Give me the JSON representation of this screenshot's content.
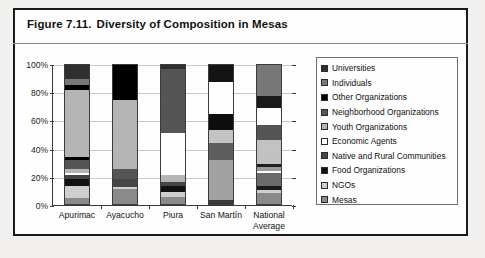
{
  "figure": {
    "number": "Figure 7.11.",
    "title": "Diversity of Composition in Mesas"
  },
  "legend": {
    "position": "right",
    "items": [
      {
        "label": "Universities",
        "color": "#2f2f2f"
      },
      {
        "label": "Individuals",
        "color": "#787878"
      },
      {
        "label": "Other Organizations",
        "color": "#000000"
      },
      {
        "label": "Neighborhood Organizations",
        "color": "#555555"
      },
      {
        "label": "Youth Organizations",
        "color": "#b5b5b5"
      },
      {
        "label": "Economic Agents",
        "color": "#ffffff"
      },
      {
        "label": "Native and Rural Communities",
        "color": "#454545"
      },
      {
        "label": "Food Organizations",
        "color": "#111111"
      },
      {
        "label": "NGOs",
        "color": "#cfcfcf"
      },
      {
        "label": "Mesas",
        "color": "#8a8a8a"
      }
    ]
  },
  "chart_data": {
    "type": "bar",
    "stacked": true,
    "normalized": "100%",
    "title": "Diversity of Composition in Mesas",
    "xlabel": "",
    "ylabel": "",
    "ylim": [
      0,
      100
    ],
    "yticks": [
      0,
      20,
      40,
      60,
      80,
      100
    ],
    "ytick_labels": [
      "0%",
      "20%",
      "40%",
      "60%",
      "80%",
      "100%"
    ],
    "grid": true,
    "legend_position": "right",
    "categories": [
      "Apurimac",
      "Ayacucho",
      "Piura",
      "San Martín",
      "National Average"
    ],
    "series": [
      {
        "name": "Mesas",
        "color": "#8a8a8a",
        "values": [
          4,
          11,
          5,
          3,
          8
        ]
      },
      {
        "name": "NGOs",
        "color": "#cfcfcf",
        "values": [
          9,
          7,
          4,
          29,
          9
        ]
      },
      {
        "name": "Food Organizations",
        "color": "#111111",
        "values": [
          5,
          0,
          4,
          0,
          4
        ]
      },
      {
        "name": "Native and Rural Communities",
        "color": "#454545",
        "values": [
          3,
          0,
          3,
          12,
          5
        ]
      },
      {
        "name": "Economic Agents",
        "color": "#ffffff",
        "values": [
          1,
          0,
          0,
          0,
          2
        ]
      },
      {
        "name": "Youth Organizations",
        "color": "#b5b5b5",
        "values": [
          3,
          0,
          5,
          9,
          3
        ]
      },
      {
        "name": "Neighborhood Organizations",
        "color": "#555555",
        "values": [
          7,
          7,
          0,
          0,
          4
        ]
      },
      {
        "name": "Other Organizations",
        "color": "#000000",
        "values": [
          2,
          0,
          0,
          12,
          0
        ]
      },
      {
        "name": "Economic Agents (upper)",
        "color": "#ffffff",
        "values": [
          0,
          0,
          30,
          0,
          0
        ]
      },
      {
        "name": "Youth Organizations (upper)",
        "color": "#b5b5b5",
        "values": [
          48,
          50,
          0,
          0,
          17
        ]
      },
      {
        "name": "Neighborhood (upper)",
        "color": "#555555",
        "values": [
          0,
          0,
          46,
          0,
          11
        ]
      },
      {
        "name": "Other Organizations (upper)",
        "color": "#000000",
        "values": [
          4,
          25,
          0,
          0,
          0
        ]
      },
      {
        "name": "Economic Agents (top)",
        "color": "#ffffff",
        "values": [
          0,
          0,
          0,
          23,
          12
        ]
      },
      {
        "name": "Individuals",
        "color": "#787878",
        "values": [
          4,
          0,
          0,
          0,
          0
        ]
      },
      {
        "name": "Universities",
        "color": "#2f2f2f",
        "values": [
          10,
          0,
          3,
          12,
          25
        ]
      }
    ],
    "bars": [
      {
        "category": "Apurimac",
        "segments": [
          {
            "name": "Mesas",
            "color": "#8a8a8a",
            "value": 4
          },
          {
            "name": "NGOs",
            "color": "#cfcfcf",
            "value": 9
          },
          {
            "name": "Food Organizations",
            "color": "#111111",
            "value": 5
          },
          {
            "name": "Native and Rural Communities",
            "color": "#454545",
            "value": 3
          },
          {
            "name": "Economic Agents",
            "color": "#ffffff",
            "value": 1
          },
          {
            "name": "Youth Organizations",
            "color": "#b5b5b5",
            "value": 3
          },
          {
            "name": "Neighborhood Organizations",
            "color": "#555555",
            "value": 7
          },
          {
            "name": "Other Organizations",
            "color": "#000000",
            "value": 2
          },
          {
            "name": "Youth Organizations",
            "color": "#b5b5b5",
            "value": 48
          },
          {
            "name": "Other Organizations",
            "color": "#000000",
            "value": 4
          },
          {
            "name": "Individuals",
            "color": "#787878",
            "value": 4
          },
          {
            "name": "Universities",
            "color": "#2f2f2f",
            "value": 10
          }
        ]
      },
      {
        "category": "Ayacucho",
        "segments": [
          {
            "name": "Mesas",
            "color": "#8a8a8a",
            "value": 11
          },
          {
            "name": "NGOs",
            "color": "#cfcfcf",
            "value": 1
          },
          {
            "name": "Native and Rural Communities",
            "color": "#454545",
            "value": 6
          },
          {
            "name": "Neighborhood Organizations",
            "color": "#555555",
            "value": 7
          },
          {
            "name": "Youth Organizations",
            "color": "#b5b5b5",
            "value": 50
          },
          {
            "name": "Other Organizations",
            "color": "#000000",
            "value": 25
          }
        ]
      },
      {
        "category": "Piura",
        "segments": [
          {
            "name": "Mesas",
            "color": "#8a8a8a",
            "value": 5
          },
          {
            "name": "NGOs",
            "color": "#cfcfcf",
            "value": 4
          },
          {
            "name": "Food Organizations",
            "color": "#111111",
            "value": 4
          },
          {
            "name": "Native and Rural Communities",
            "color": "#454545",
            "value": 3
          },
          {
            "name": "Youth Organizations",
            "color": "#b5b5b5",
            "value": 5
          },
          {
            "name": "Economic Agents",
            "color": "#ffffff",
            "value": 30
          },
          {
            "name": "Neighborhood Organizations",
            "color": "#555555",
            "value": 46
          },
          {
            "name": "Universities",
            "color": "#2f2f2f",
            "value": 3
          }
        ]
      },
      {
        "category": "San Martín",
        "segments": [
          {
            "name": "Mesas",
            "color": "#3a3a3a",
            "value": 3
          },
          {
            "name": "NGOs",
            "color": "#a2a2a2",
            "value": 29
          },
          {
            "name": "Native and Rural Communities",
            "color": "#5e5e5e",
            "value": 12
          },
          {
            "name": "Youth Organizations",
            "color": "#c4c4c4",
            "value": 9
          },
          {
            "name": "Other Organizations",
            "color": "#0d0d0d",
            "value": 12
          },
          {
            "name": "Economic Agents",
            "color": "#ffffff",
            "value": 23
          },
          {
            "name": "Universities",
            "color": "#141414",
            "value": 12
          }
        ]
      },
      {
        "category": "National Average",
        "segments": [
          {
            "name": "Mesas",
            "color": "#8a8a8a",
            "value": 8
          },
          {
            "name": "NGOs",
            "color": "#cfcfcf",
            "value": 2
          },
          {
            "name": "Food Organizations",
            "color": "#1a1a1a",
            "value": 3
          },
          {
            "name": "Native and Rural Communities",
            "color": "#6b6b6b",
            "value": 9
          },
          {
            "name": "Economic Agents",
            "color": "#ffffff",
            "value": 2
          },
          {
            "name": "Youth Organizations",
            "color": "#9a9a9a",
            "value": 3
          },
          {
            "name": "Food Organizations",
            "color": "#1f1f1f",
            "value": 2
          },
          {
            "name": "Youth Organizations",
            "color": "#c2c2c2",
            "value": 17
          },
          {
            "name": "Neighborhood Organizations",
            "color": "#555555",
            "value": 11
          },
          {
            "name": "Economic Agents",
            "color": "#ffffff",
            "value": 12
          },
          {
            "name": "Universities",
            "color": "#1a1a1a",
            "value": 9
          },
          {
            "name": "Individuals",
            "color": "#787878",
            "value": 22
          }
        ]
      }
    ]
  }
}
